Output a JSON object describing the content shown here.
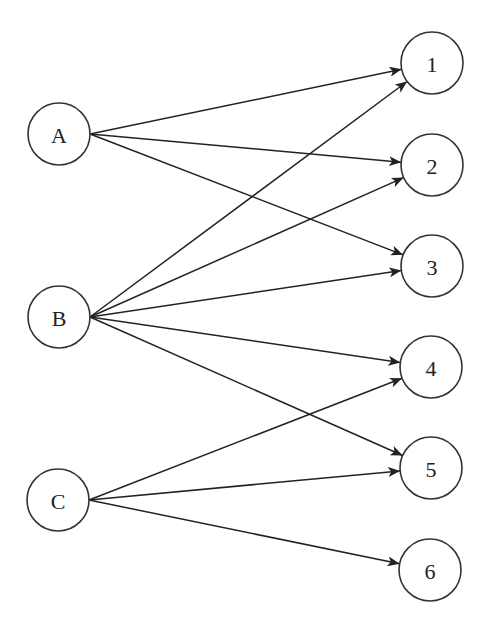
{
  "diagram": {
    "type": "bipartite-directed-graph",
    "colors": {
      "stroke": "#333333",
      "edge": "#222222",
      "background": "#ffffff",
      "text": "#222222"
    },
    "radius": 31,
    "left_nodes": [
      {
        "id": "A",
        "label": "A",
        "x": 59,
        "y": 134
      },
      {
        "id": "B",
        "label": "B",
        "x": 59,
        "y": 317
      },
      {
        "id": "C",
        "label": "C",
        "x": 58,
        "y": 500
      }
    ],
    "right_nodes": [
      {
        "id": "1",
        "label": "1",
        "x": 432,
        "y": 63
      },
      {
        "id": "2",
        "label": "2",
        "x": 432,
        "y": 165
      },
      {
        "id": "3",
        "label": "3",
        "x": 432,
        "y": 266
      },
      {
        "id": "4",
        "label": "4",
        "x": 431,
        "y": 367
      },
      {
        "id": "5",
        "label": "5",
        "x": 431,
        "y": 468
      },
      {
        "id": "6",
        "label": "6",
        "x": 430,
        "y": 570
      }
    ],
    "edges": [
      {
        "from": "A",
        "to": "1"
      },
      {
        "from": "A",
        "to": "2"
      },
      {
        "from": "A",
        "to": "3"
      },
      {
        "from": "B",
        "to": "1"
      },
      {
        "from": "B",
        "to": "2"
      },
      {
        "from": "B",
        "to": "3"
      },
      {
        "from": "B",
        "to": "4"
      },
      {
        "from": "B",
        "to": "5"
      },
      {
        "from": "C",
        "to": "4"
      },
      {
        "from": "C",
        "to": "5"
      },
      {
        "from": "C",
        "to": "6"
      }
    ]
  }
}
